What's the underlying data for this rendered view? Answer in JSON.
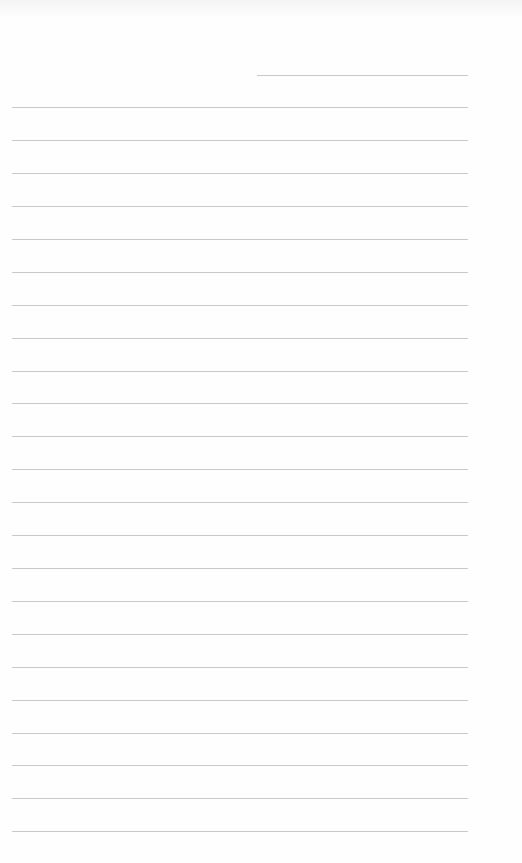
{
  "page": {
    "type": "blank-lined-paper",
    "background_color": "#fefefe",
    "line_color": "#c9c9c9",
    "header_line": {
      "x_start": 257,
      "x_end": 468,
      "y": 75
    },
    "ruled_lines": {
      "count": 23,
      "x_start": 12,
      "x_end": 468,
      "y_positions": [
        107,
        140,
        173,
        206,
        239,
        272,
        305,
        338,
        371,
        403,
        436,
        469,
        502,
        535,
        568,
        601,
        634,
        667,
        700,
        733,
        765,
        798,
        831
      ]
    }
  }
}
